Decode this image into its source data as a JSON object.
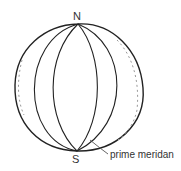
{
  "diagram": {
    "north_label": "N",
    "south_label": "S",
    "callout_label": "prime meridan",
    "colors": {
      "stroke": "#222222",
      "leader": "#555555",
      "shading": "#999999",
      "text": "#333333"
    }
  }
}
